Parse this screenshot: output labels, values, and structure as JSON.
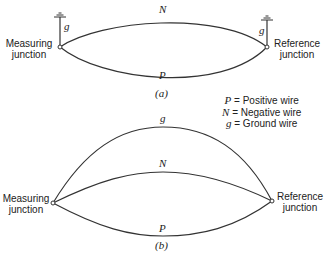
{
  "diagram_a": {
    "label": "(a)",
    "wire_top_label": "N",
    "wire_bottom_label": "P",
    "left_ground_label": "g",
    "right_ground_label": "g",
    "left_junction": {
      "line1": "Measuring",
      "line2": "junction"
    },
    "right_junction": {
      "line1": "Reference",
      "line2": "junction"
    }
  },
  "legend": {
    "items": [
      {
        "symbol": "P",
        "text": "= Positive wire"
      },
      {
        "symbol": "N",
        "text": "= Negative wire"
      },
      {
        "symbol": "g",
        "text": "= Ground wire"
      }
    ]
  },
  "diagram_b": {
    "label": "(b)",
    "wire_top_label": "g",
    "wire_middle_label": "N",
    "wire_bottom_label": "P",
    "left_junction": {
      "line1": "Measuring",
      "line2": "junction"
    },
    "right_junction": {
      "line1": "Reference",
      "line2": "junction"
    }
  },
  "colors": {
    "line": "#333333",
    "text": "#222222",
    "background": "#ffffff"
  }
}
